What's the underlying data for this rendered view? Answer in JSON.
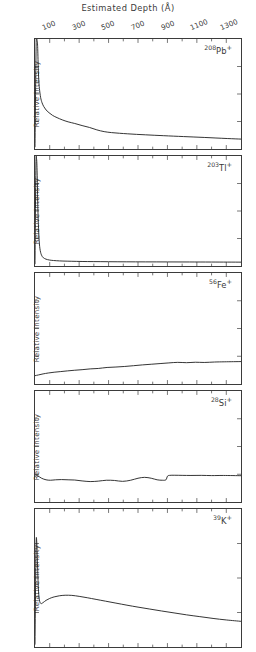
{
  "chart_data": {
    "type": "line",
    "title": "Estimated Depth (Å)",
    "xlabel": "Estimated Depth (Å)",
    "ylabel": "Relative Intensity",
    "xlim": [
      0,
      1400
    ],
    "xticks_major": [
      100,
      300,
      500,
      700,
      900,
      1100,
      1300
    ],
    "xticklabels": [
      "100",
      "300",
      "500",
      "700",
      "900",
      "1100",
      "1300"
    ],
    "xticks_minor": [
      200,
      400,
      600,
      800,
      1000,
      1200
    ],
    "grid": false,
    "legend": "none",
    "axis_position": "top",
    "panel_count": 5,
    "series": [
      {
        "name": "208Pb+",
        "label_isotope": "208",
        "label_element": "Pb",
        "label_charge": "+",
        "ylim": [
          0,
          1
        ],
        "x": [
          0,
          8,
          14,
          18,
          22,
          26,
          30,
          38,
          48,
          60,
          75,
          95,
          120,
          150,
          185,
          225,
          270,
          320,
          370,
          420,
          470,
          520,
          575,
          630,
          690,
          750,
          810,
          875,
          940,
          1010,
          1080,
          1150,
          1230,
          1310,
          1400
        ],
        "values": [
          0.02,
          0.97,
          0.99,
          0.93,
          0.74,
          0.62,
          0.55,
          0.47,
          0.42,
          0.385,
          0.355,
          0.33,
          0.305,
          0.285,
          0.265,
          0.247,
          0.232,
          0.213,
          0.196,
          0.174,
          0.158,
          0.149,
          0.143,
          0.138,
          0.133,
          0.129,
          0.125,
          0.121,
          0.117,
          0.113,
          0.109,
          0.105,
          0.1,
          0.095,
          0.09
        ]
      },
      {
        "name": "203Tl+",
        "label_isotope": "203",
        "label_element": "Tl",
        "label_charge": "+",
        "ylim": [
          0,
          1
        ],
        "x": [
          0,
          6,
          11,
          15,
          19,
          24,
          30,
          38,
          50,
          65,
          85,
          110,
          145,
          190,
          250,
          320,
          400,
          500,
          620,
          750,
          900,
          1050,
          1200,
          1400
        ],
        "values": [
          0.02,
          0.9,
          0.97,
          0.82,
          0.55,
          0.34,
          0.2,
          0.125,
          0.085,
          0.068,
          0.058,
          0.052,
          0.048,
          0.045,
          0.043,
          0.041,
          0.04,
          0.039,
          0.038,
          0.0375,
          0.037,
          0.0365,
          0.036,
          0.035
        ]
      },
      {
        "name": "56Fe+",
        "label_isotope": "56",
        "label_element": "Fe",
        "label_charge": "+",
        "ylim": [
          0,
          1
        ],
        "x": [
          0,
          25,
          55,
          90,
          130,
          175,
          220,
          270,
          320,
          375,
          430,
          490,
          550,
          610,
          670,
          730,
          790,
          850,
          910,
          970,
          1030,
          1090,
          1150,
          1220,
          1290,
          1400
        ],
        "values": [
          0.075,
          0.082,
          0.091,
          0.099,
          0.106,
          0.112,
          0.118,
          0.124,
          0.129,
          0.136,
          0.14,
          0.149,
          0.153,
          0.158,
          0.165,
          0.172,
          0.178,
          0.184,
          0.19,
          0.195,
          0.192,
          0.196,
          0.194,
          0.198,
          0.2,
          0.202
        ]
      },
      {
        "name": "28Si+",
        "label_isotope": "28",
        "label_element": "Si",
        "label_charge": "+",
        "ylim": [
          0,
          1
        ],
        "x": [
          0,
          20,
          45,
          75,
          105,
          140,
          180,
          225,
          270,
          320,
          375,
          430,
          485,
          540,
          595,
          650,
          700,
          745,
          790,
          830,
          865,
          890,
          900,
          915,
          950,
          1000,
          1060,
          1130,
          1200,
          1280,
          1400
        ],
        "values": [
          0.245,
          0.235,
          0.214,
          0.2,
          0.196,
          0.2,
          0.202,
          0.2,
          0.198,
          0.19,
          0.184,
          0.188,
          0.196,
          0.194,
          0.186,
          0.196,
          0.214,
          0.222,
          0.214,
          0.2,
          0.196,
          0.2,
          0.232,
          0.24,
          0.241,
          0.24,
          0.239,
          0.24,
          0.238,
          0.239,
          0.237
        ]
      },
      {
        "name": "39K+",
        "label_isotope": "39",
        "label_element": "K",
        "label_charge": "+",
        "ylim": [
          0,
          1
        ],
        "x": [
          0,
          7,
          12,
          17,
          23,
          30,
          40,
          55,
          75,
          100,
          130,
          165,
          205,
          250,
          300,
          355,
          415,
          480,
          550,
          625,
          700,
          780,
          860,
          945,
          1030,
          1120,
          1210,
          1300,
          1400
        ],
        "values": [
          0.02,
          0.72,
          0.76,
          0.6,
          0.42,
          0.34,
          0.315,
          0.322,
          0.338,
          0.352,
          0.363,
          0.371,
          0.375,
          0.374,
          0.367,
          0.357,
          0.345,
          0.332,
          0.318,
          0.303,
          0.289,
          0.275,
          0.261,
          0.247,
          0.233,
          0.22,
          0.207,
          0.196,
          0.186
        ]
      }
    ]
  },
  "figure": {
    "title": "Estimated Depth (Å)",
    "y_axis_label": "Relative Intensity",
    "tick_labels": [
      "100",
      "300",
      "500",
      "700",
      "900",
      "1100",
      "1300"
    ],
    "ink_color": "#3b3b3b",
    "background_color": "#ffffff"
  }
}
